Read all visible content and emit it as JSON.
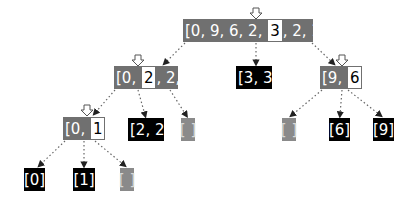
{
  "diagram": {
    "colors": {
      "unsorted_box": "#707070",
      "final_box": "#000000",
      "empty_box": "#8a8a8a",
      "pivot_bg": "#ffffff",
      "edge": "#555555"
    },
    "nodes": [
      {
        "id": "root",
        "pre": "[0, 9, 6, 2, ",
        "pivot": "3",
        "post": ", 2, 1, 3]",
        "style": "gray",
        "has_pivot": true
      },
      {
        "id": "left",
        "pre": "[0, ",
        "pivot": "2",
        "post": ", 2, 1]",
        "style": "gray",
        "has_pivot": true
      },
      {
        "id": "middle",
        "text": "[3, 3]",
        "style": "black"
      },
      {
        "id": "right",
        "pre": "[9, ",
        "pivot": "6",
        "post": "]",
        "style": "gray",
        "has_pivot": true
      },
      {
        "id": "left-left",
        "pre": "[0, ",
        "pivot": "1",
        "post": "]",
        "style": "gray",
        "has_pivot": true
      },
      {
        "id": "left-middle",
        "text": "[2, 2]",
        "style": "black"
      },
      {
        "id": "left-right",
        "text": "[ ]",
        "style": "light"
      },
      {
        "id": "right-left",
        "text": "[ ]",
        "style": "light"
      },
      {
        "id": "right-middle",
        "text": "[6]",
        "style": "black"
      },
      {
        "id": "right-right",
        "text": "[9]",
        "style": "black"
      },
      {
        "id": "ll-left",
        "text": "[0]",
        "style": "black"
      },
      {
        "id": "ll-middle",
        "text": "[1]",
        "style": "black"
      },
      {
        "id": "ll-right",
        "text": "[ ]",
        "style": "light"
      }
    ]
  }
}
